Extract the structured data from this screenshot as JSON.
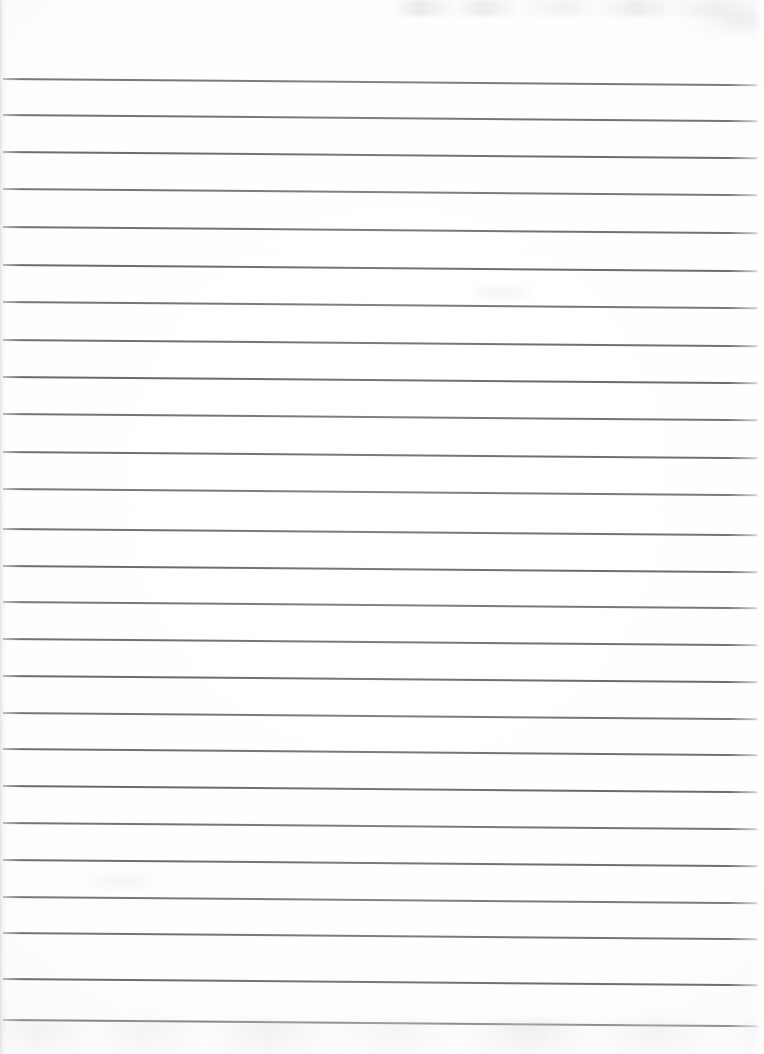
{
  "document": {
    "kind": "scanned-blank-ruled-notebook-page",
    "title": "Blank Lined Notebook Page",
    "page_width": 764,
    "page_height": 1054,
    "orientation": "portrait",
    "has_text_content": false,
    "handwriting_present": false,
    "background_color": "#fdfdfd",
    "paper_tone": "#ffffff"
  },
  "ruling": {
    "style": "wide-ruled horizontal lines",
    "line_color": "#686a73",
    "line_thickness_px": 1.5,
    "line_count": 26,
    "spacing_px": 36.7,
    "first_line_y": 78,
    "last_line_y": 1019,
    "left_x": 3,
    "right_x": 758,
    "skew_degrees": 0.48,
    "vertical_margin_rule": false,
    "line_y_positions": [
      78,
      114,
      151,
      188,
      226,
      264,
      301,
      339,
      376,
      413,
      451,
      488,
      528,
      565,
      601,
      638,
      675,
      712,
      748,
      785,
      822,
      859,
      896,
      932,
      978,
      1019
    ]
  },
  "header_zone": {
    "description": "Unruled blank margin above the first ruled line",
    "height_px": 78,
    "content": ""
  },
  "artifacts": {
    "left_edge_shadow": "faint vertical page-edge shadow along the left border",
    "right_edge_highlight": "scanner brightening along the right border",
    "top_band": "faint gray scan noise across the upper-right of the header zone",
    "bottom_band": "faint smudge and texture band below the final ruled line"
  }
}
